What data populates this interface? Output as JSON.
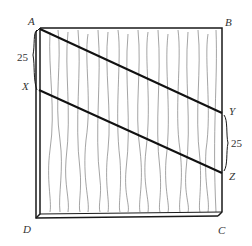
{
  "diagram": {
    "type": "wooden board with two parallel cut lines",
    "vertices": {
      "A": "A",
      "B": "B",
      "C": "C",
      "D": "D"
    },
    "points": {
      "X": "X",
      "Y": "Y",
      "Z": "Z"
    },
    "measurements": {
      "AX": "25",
      "YZ": "25"
    },
    "lines": [
      "AY",
      "XZ"
    ],
    "colors": {
      "stroke": "#1a1a1a",
      "grain": "#555555",
      "background": "#ffffff"
    }
  }
}
